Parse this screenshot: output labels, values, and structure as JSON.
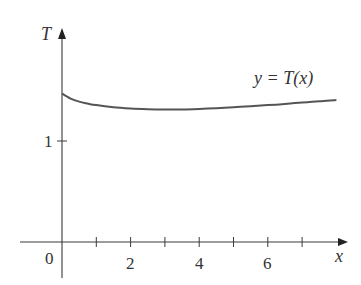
{
  "chart_data": {
    "type": "line",
    "title": "",
    "xlabel": "x",
    "ylabel": "T",
    "x_ticks": [
      1,
      2,
      3,
      4,
      5,
      6,
      7
    ],
    "x_tick_labels": [
      "2",
      "4",
      "6"
    ],
    "x_tick_label_values": [
      2,
      4,
      6
    ],
    "y_ticks": [
      1
    ],
    "y_tick_labels": [
      "1"
    ],
    "origin_label": "0",
    "xlim": [
      -1.2,
      8.3
    ],
    "ylim": [
      -0.35,
      1.9
    ],
    "grid": false,
    "legend": null,
    "annotations": [
      {
        "text": "y = T(x)",
        "x": 6.3,
        "y": 1.5
      }
    ],
    "series": [
      {
        "name": "y = T(x)",
        "color": "#555555",
        "x": [
          0,
          0.25,
          0.5,
          0.75,
          1,
          1.5,
          2,
          2.5,
          3,
          3.5,
          4,
          4.5,
          5,
          5.5,
          6,
          6.5,
          7,
          7.5,
          8
        ],
        "y": [
          1.47,
          1.42,
          1.39,
          1.37,
          1.355,
          1.335,
          1.322,
          1.315,
          1.312,
          1.313,
          1.318,
          1.325,
          1.334,
          1.344,
          1.355,
          1.367,
          1.38,
          1.393,
          1.407
        ]
      }
    ]
  },
  "labels": {
    "y_axis": "T",
    "x_axis": "x",
    "origin": "0",
    "y_tick_1": "1",
    "x_tick_2": "2",
    "x_tick_4": "4",
    "x_tick_6": "6",
    "curve_label": "y = T(x)"
  }
}
